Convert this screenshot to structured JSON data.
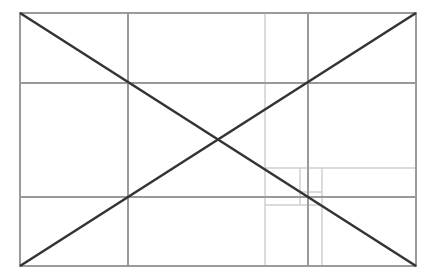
{
  "diagram": {
    "width": 434,
    "height": 278,
    "frame": {
      "x1": 20,
      "y1": 13,
      "x2": 416,
      "y2": 266
    },
    "colors": {
      "frame": "#9a9a9a",
      "thirds": "#999999",
      "golden": "#cfcfcf",
      "diagonal": "#333333",
      "background": "#ffffff"
    },
    "thirds_lines": {
      "vertical_x": [
        128,
        308
      ],
      "horizontal_y": [
        83,
        197
      ]
    },
    "golden_lines": [
      {
        "x1": 265,
        "y1": 13,
        "x2": 265,
        "y2": 266
      },
      {
        "x1": 265,
        "y1": 168,
        "x2": 416,
        "y2": 168
      },
      {
        "x1": 322,
        "y1": 168,
        "x2": 322,
        "y2": 266
      },
      {
        "x1": 265,
        "y1": 205,
        "x2": 322,
        "y2": 205
      },
      {
        "x1": 300,
        "y1": 168,
        "x2": 300,
        "y2": 205
      },
      {
        "x1": 300,
        "y1": 192,
        "x2": 322,
        "y2": 192
      }
    ],
    "diagonals": [
      {
        "x1": 20,
        "y1": 13,
        "x2": 416,
        "y2": 266
      },
      {
        "x1": 20,
        "y1": 266,
        "x2": 416,
        "y2": 13
      }
    ]
  }
}
